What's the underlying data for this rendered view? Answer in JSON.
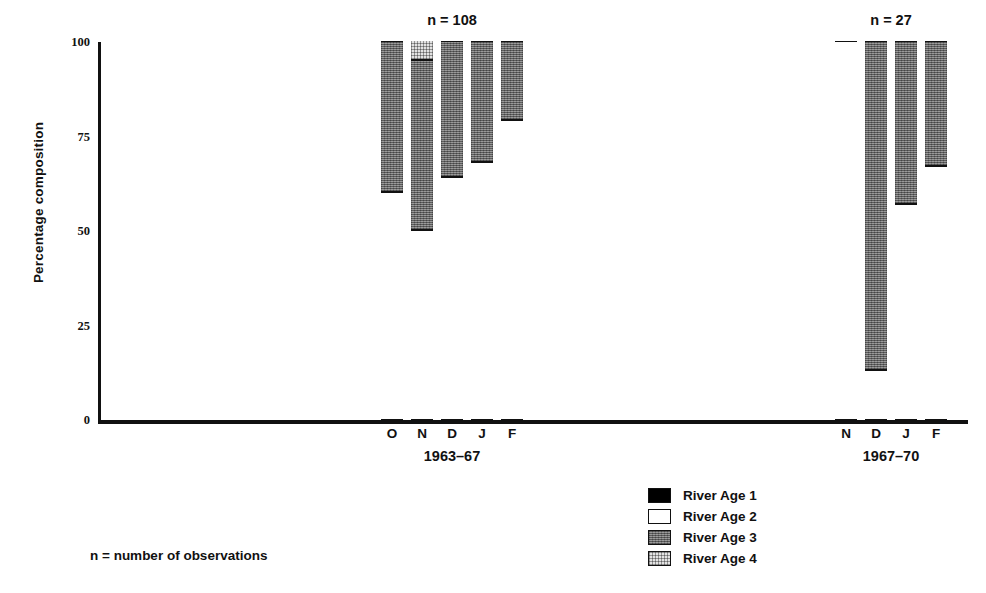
{
  "chart_data": {
    "type": "bar",
    "subtype": "stacked-percentage-column",
    "title": "",
    "xlabel": "",
    "ylabel": "Percentage composition",
    "ylim": [
      0,
      100
    ],
    "yticks": [
      0,
      25,
      50,
      75,
      100
    ],
    "ytick_labels": [
      "0",
      "25",
      "50",
      "75",
      "100"
    ],
    "grid": false,
    "legend_position": "bottom-center",
    "legend_entries": [
      {
        "label": "River Age 1",
        "key": "age1",
        "fill": "black"
      },
      {
        "label": "River Age 2",
        "key": "age2",
        "fill": "white"
      },
      {
        "label": "River Age 3",
        "key": "age3",
        "fill": "dark-gray-texture"
      },
      {
        "label": "River Age 4",
        "key": "age4",
        "fill": "light-stipple"
      }
    ],
    "series": [
      {
        "name": "River Age 1",
        "key": "age1"
      },
      {
        "name": "River Age 2",
        "key": "age2"
      },
      {
        "name": "River Age 3",
        "key": "age3"
      },
      {
        "name": "River Age 4",
        "key": "age4"
      }
    ],
    "groups": [
      {
        "period": "1963–67",
        "n_label": "n = 108",
        "n": 108,
        "categories": [
          "O",
          "N",
          "D",
          "J",
          "F"
        ],
        "bars": [
          {
            "category": "O",
            "age1": 0,
            "age2": 60,
            "age3": 40,
            "age4": 0
          },
          {
            "category": "N",
            "age1": 0,
            "age2": 50,
            "age3": 45,
            "age4": 5
          },
          {
            "category": "D",
            "age1": 0,
            "age2": 64,
            "age3": 36,
            "age4": 0
          },
          {
            "category": "J",
            "age1": 0,
            "age2": 68,
            "age3": 32,
            "age4": 0
          },
          {
            "category": "F",
            "age1": 0,
            "age2": 79,
            "age3": 21,
            "age4": 0
          }
        ]
      },
      {
        "period": "1967–70",
        "n_label": "n = 27",
        "n": 27,
        "categories": [
          "N",
          "D",
          "J",
          "F"
        ],
        "bars": [
          {
            "category": "N",
            "age1": 0,
            "age2": 100,
            "age3": 0,
            "age4": 0
          },
          {
            "category": "D",
            "age1": 0,
            "age2": 13,
            "age3": 87,
            "age4": 0
          },
          {
            "category": "J",
            "age1": 0,
            "age2": 57,
            "age3": 43,
            "age4": 0
          },
          {
            "category": "F",
            "age1": 0,
            "age2": 67,
            "age3": 33,
            "age4": 0
          }
        ]
      }
    ]
  },
  "footnote": "n = number of observations"
}
